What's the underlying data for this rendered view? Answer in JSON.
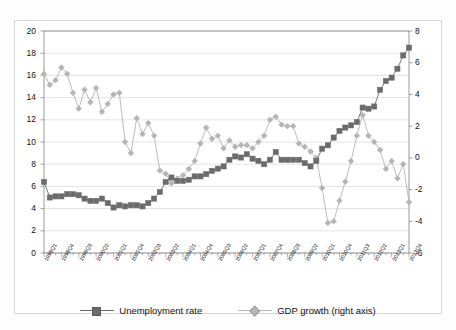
{
  "chart_data": {
    "type": "line",
    "title": "",
    "subtitle": "",
    "xlabel": "",
    "ylabel": "",
    "y2label": "",
    "ylim": [
      0,
      20
    ],
    "y2lim": [
      -6,
      8
    ],
    "yticks": [
      0,
      2,
      4,
      6,
      8,
      10,
      12,
      14,
      16,
      18,
      20
    ],
    "y2ticks": [
      -6,
      -4,
      -2,
      0,
      2,
      4,
      6,
      8
    ],
    "grid": "horizontal",
    "legend_position": "bottom",
    "categories": [
      "1998Q1",
      "1998Q2",
      "1998Q3",
      "1998Q4",
      "1999Q1",
      "1999Q2",
      "1999Q3",
      "1999Q4",
      "2000Q1",
      "2000Q2",
      "2000Q3",
      "2000Q4",
      "2001Q1",
      "2001Q2",
      "2001Q3",
      "2001Q4",
      "2002Q1",
      "2002Q2",
      "2002Q3",
      "2002Q4",
      "2003Q1",
      "2003Q2",
      "2003Q3",
      "2003Q4",
      "2004Q1",
      "2004Q2",
      "2004Q3",
      "2004Q4",
      "2005Q1",
      "2005Q2",
      "2005Q3",
      "2005Q4",
      "2006Q1",
      "2006Q2",
      "2006Q3",
      "2006Q4",
      "2007Q1",
      "2007Q2",
      "2007Q3",
      "2007Q4",
      "2008Q1",
      "2008Q2",
      "2008Q3",
      "2008Q4",
      "2009Q1",
      "2009Q2",
      "2009Q3",
      "2009Q4",
      "2010Q1",
      "2010Q2",
      "2010Q3",
      "2010Q4",
      "2011Q1",
      "2011Q2",
      "2011Q3",
      "2011Q4",
      "2012Q1",
      "2012Q2",
      "2012Q3",
      "2012Q4",
      "2013Q1",
      "2013Q2",
      "2013Q3",
      "2013Q4"
    ],
    "tick_label_every": 3,
    "visible_tick_labels": [
      "1998Q1",
      "1998Q4",
      "1999Q3",
      "2000Q2",
      "2001Q1",
      "2001Q4",
      "2002Q3",
      "2003Q2",
      "2004Q1",
      "2004Q4",
      "2005Q3",
      "2006Q2",
      "2007Q1",
      "2007Q4",
      "2008Q3",
      "2009Q2",
      "2010Q1",
      "2010Q4",
      "2011Q3",
      "2012Q2",
      "2013Q1",
      "2013Q4"
    ],
    "series": [
      {
        "name": "Unemployment rate",
        "axis": "left",
        "color": "#6b6b6b",
        "marker": "square",
        "values": [
          6.4,
          5.0,
          5.1,
          5.1,
          5.3,
          5.3,
          5.2,
          4.9,
          4.7,
          4.7,
          4.9,
          4.5,
          4.1,
          4.3,
          4.2,
          4.3,
          4.3,
          4.2,
          4.5,
          4.9,
          5.5,
          6.4,
          6.8,
          6.5,
          6.5,
          6.6,
          6.9,
          6.9,
          7.1,
          7.4,
          7.6,
          7.8,
          8.4,
          8.7,
          8.6,
          8.9,
          8.5,
          8.3,
          8.0,
          8.4,
          9.1,
          8.4,
          8.4,
          8.4,
          8.4,
          8.1,
          7.8,
          8.3,
          9.4,
          9.7,
          10.4,
          11.0,
          11.3,
          11.5,
          11.8,
          13.1,
          13.0,
          13.2,
          14.7,
          15.5,
          15.8,
          16.6,
          17.8,
          18.5
        ]
      },
      {
        "name": "GDP growth (right axis)",
        "axis": "right",
        "color": "#b4b4b4",
        "marker": "diamond",
        "values": [
          5.3,
          4.6,
          4.9,
          5.7,
          5.3,
          4.1,
          3.1,
          4.3,
          3.5,
          4.4,
          2.9,
          3.4,
          4.0,
          4.1,
          1.0,
          0.3,
          2.5,
          1.5,
          2.2,
          1.4,
          -0.8,
          -1.0,
          -1.6,
          -1.3,
          -1.1,
          -0.7,
          -0.2,
          0.9,
          1.9,
          1.2,
          1.4,
          0.6,
          1.1,
          0.7,
          0.8,
          0.8,
          0.6,
          1.0,
          1.4,
          2.4,
          2.6,
          2.1,
          2.0,
          2.0,
          0.9,
          0.7,
          0.4,
          0.0,
          -1.9,
          -4.1,
          -4.0,
          -2.7,
          -1.5,
          -0.2,
          1.4,
          2.7,
          1.4,
          1.0,
          0.5,
          -0.7,
          -0.2,
          -1.3,
          -0.4,
          -2.8
        ]
      }
    ]
  },
  "legend": {
    "items": [
      {
        "label": "Unemployment rate",
        "marker": "square",
        "color": "#6b6b6b"
      },
      {
        "label": "GDP growth (right axis)",
        "marker": "diamond",
        "color": "#b4b4b4"
      }
    ]
  },
  "colors": {
    "unemployment": "#6b6b6b",
    "gdp": "#b4b4b4",
    "grid": "#d9d9d9",
    "axis": "#808080",
    "text": "#111111",
    "background": "#ffffff"
  }
}
